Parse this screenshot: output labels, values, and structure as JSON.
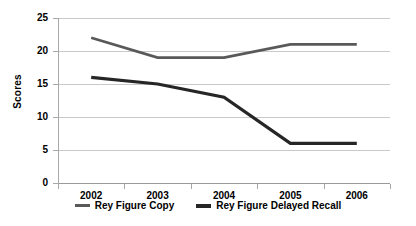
{
  "chart_data": {
    "type": "line",
    "title": "",
    "xlabel": "",
    "ylabel": "Scores",
    "categories": [
      "2002",
      "2003",
      "2004",
      "2005",
      "2006"
    ],
    "ylim": [
      0,
      25
    ],
    "yticks": [
      0,
      5,
      10,
      15,
      20,
      25
    ],
    "ytick_labels": [
      "0",
      "5",
      "10",
      "15",
      "20",
      "25"
    ],
    "grid": true,
    "legend_position": "bottom",
    "series": [
      {
        "name": "Rey Figure Copy",
        "color": "#595959",
        "values": [
          22,
          19,
          19,
          21,
          21
        ]
      },
      {
        "name": "Rey Figure Delayed Recall",
        "color": "#262626",
        "values": [
          16,
          15,
          13,
          6,
          6
        ]
      }
    ]
  },
  "axis": {
    "y_title": "Scores",
    "ytick_labels": [
      "25",
      "20",
      "15",
      "10",
      "5",
      "0"
    ],
    "xtick_labels": [
      "2002",
      "2003",
      "2004",
      "2005",
      "2006"
    ]
  },
  "legend": {
    "entries": [
      {
        "label": "Rey Figure Copy",
        "color": "#595959"
      },
      {
        "label": "Rey Figure Delayed Recall",
        "color": "#262626"
      }
    ]
  },
  "colors": {
    "gridline": "#c9c9c9",
    "axis": "#a8a8a8",
    "background": "#ffffff",
    "text": "#000000"
  }
}
